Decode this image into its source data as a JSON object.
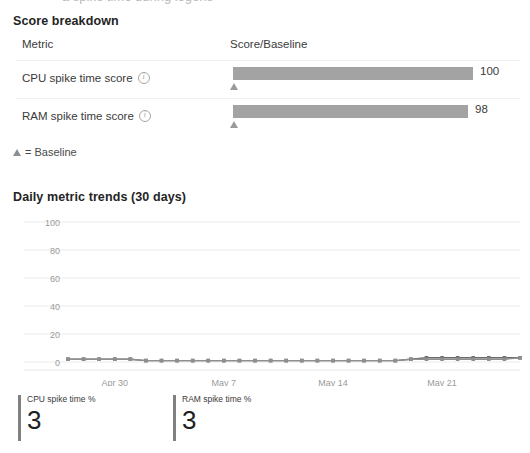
{
  "page": {
    "top_cut_text": "a spike time during logons"
  },
  "score_breakdown": {
    "title": "Score breakdown",
    "columns": {
      "metric": "Metric",
      "score": "Score/Baseline"
    },
    "rows": [
      {
        "metric": "CPU spike time score",
        "info_icon": "info-icon",
        "value": "100",
        "value_num": 100,
        "baseline": 0,
        "bar_color": "#a3a3a3"
      },
      {
        "metric": "RAM spike time score",
        "info_icon": "info-icon",
        "value": "98",
        "value_num": 98,
        "baseline": 0,
        "bar_color": "#a3a3a3"
      }
    ],
    "legend": "= Baseline",
    "legend_icon": "triangle-up-icon"
  },
  "trends": {
    "title": "Daily metric trends (30 days)"
  },
  "chart_data": {
    "type": "line",
    "title": "Daily metric trends (30 days)",
    "xlabel": "",
    "ylabel": "",
    "ylim": [
      0,
      100
    ],
    "yticks": [
      0,
      20,
      40,
      60,
      80,
      100
    ],
    "ytick_labels": [
      "0",
      "20",
      "40",
      "60",
      "80",
      "100"
    ],
    "grid": true,
    "legend_position": "below-as-kpi-tiles",
    "x": [
      "Apr 27",
      "Apr 28",
      "Apr 29",
      "Apr 30",
      "May 1",
      "May 2",
      "May 3",
      "May 4",
      "May 5",
      "May 6",
      "May 7",
      "May 8",
      "May 9",
      "May 10",
      "May 11",
      "May 12",
      "May 13",
      "May 14",
      "May 15",
      "May 16",
      "May 17",
      "May 18",
      "May 19",
      "May 20",
      "May 21",
      "May 22",
      "May 23",
      "May 24",
      "May 25",
      "May 26"
    ],
    "xtick_labels": [
      "Apr 30",
      "May 7",
      "May 14",
      "May 21"
    ],
    "xtick_indices": [
      3,
      10,
      17,
      24
    ],
    "series": [
      {
        "name": "CPU spike time %",
        "color": "#6b6b6b",
        "values": [
          2,
          2,
          2,
          2,
          2,
          1,
          1,
          1,
          1,
          1,
          1,
          1,
          1,
          1,
          1,
          1,
          1,
          1,
          1,
          1,
          1,
          1,
          2,
          3,
          3,
          3,
          3,
          3,
          3,
          3
        ]
      },
      {
        "name": "RAM spike time %",
        "color": "#8f8f8f",
        "values": [
          2,
          2,
          2,
          2,
          2,
          1,
          1,
          1,
          1,
          1,
          1,
          1,
          1,
          1,
          1,
          1,
          1,
          1,
          1,
          1,
          1,
          1,
          2,
          2,
          2,
          2,
          2,
          2,
          2,
          3
        ]
      }
    ]
  },
  "kpis": [
    {
      "label": "CPU spike time %",
      "value": "3",
      "accent": "#808080"
    },
    {
      "label": "RAM spike time %",
      "value": "3",
      "accent": "#808080"
    }
  ]
}
